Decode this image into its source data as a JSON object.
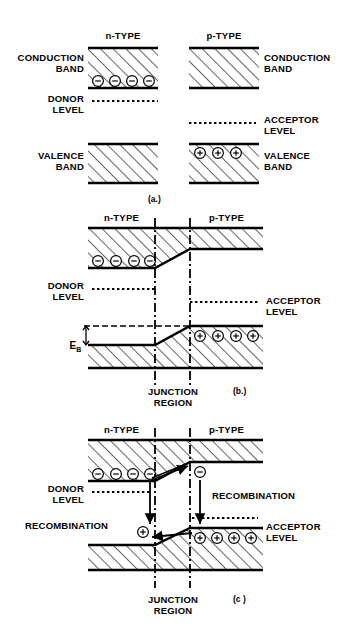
{
  "figure": {
    "background": "#ffffff",
    "ink": "#000000"
  },
  "panels": [
    {
      "id": "a",
      "caption": "(a.)",
      "type_labels": {
        "n": "n-TYPE",
        "p": "p-TYPE"
      },
      "labels": {
        "conduction_left": "CONDUCTION\nBAND",
        "conduction_right": "CONDUCTION\nBAND",
        "donor": "DONOR\nLEVEL",
        "acceptor": "ACCEPTOR\nLEVEL",
        "valence_left": "VALENCE\nBAND",
        "valence_right": "VALENCE\nBAND"
      },
      "carriers": {
        "electrons_n_conduction": 4,
        "holes_p_valence": 3
      }
    },
    {
      "id": "b",
      "caption": "(b.)",
      "type_labels": {
        "n": "n-TYPE",
        "p": "p-TYPE"
      },
      "labels": {
        "donor": "DONOR\nLEVEL",
        "acceptor": "ACCEPTOR\nLEVEL",
        "barrier": "E",
        "barrier_sub": "B",
        "junction": "JUNCTION\nREGION"
      },
      "carriers": {
        "electrons_n_conduction": 4,
        "holes_p_valence": 4
      }
    },
    {
      "id": "c",
      "caption": "(c )",
      "type_labels": {
        "n": "n-TYPE",
        "p": "p-TYPE"
      },
      "labels": {
        "donor": "DONOR\nLEVEL",
        "acceptor": "ACCEPTOR\nLEVEL",
        "recombination_right": "RECOMBINATION",
        "recombination_left": "RECOMBINATION",
        "junction": "JUNCTION\nREGION"
      },
      "carriers": {
        "electrons_n_conduction": 4,
        "electron_injected_p": 1,
        "hole_injected_n": 1,
        "holes_p_valence": 4
      }
    }
  ],
  "icons": {
    "electron": "electron-minus-circle",
    "hole": "hole-plus-circle",
    "arrow": "arrow-head"
  }
}
